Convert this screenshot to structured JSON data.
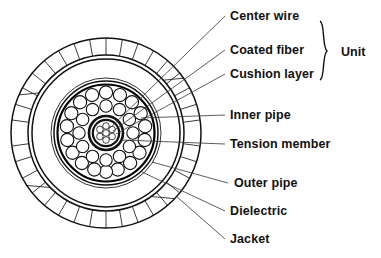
{
  "diagram": {
    "type": "cable-cross-section",
    "colors": {
      "line": "#111111",
      "background": "#ffffff",
      "leader": "#333333"
    },
    "geometry": {
      "center_x": 106,
      "center_y": 133,
      "jacket_outer_radius": 95,
      "jacket_inner_radius": 78,
      "outer_pipe_radius": 74,
      "dielectric_radius": 55,
      "inner_pipe_outer_radius": 52,
      "inner_pipe_inner_radius": 49,
      "unit_ring_radius": 38,
      "unit_count_outer": 18,
      "unit_count_inner": 12,
      "tension_member_radius": 17,
      "center_wire_radius": 3
    }
  },
  "labels": [
    {
      "id": "center-wire",
      "text": "Center wire",
      "x": 230,
      "y": 20,
      "leader_to_x": 118,
      "leader_to_y": 126
    },
    {
      "id": "coated-fiber",
      "text": "Coated fiber",
      "x": 230,
      "y": 54,
      "leader_to_x": 120,
      "leader_to_y": 131
    },
    {
      "id": "cushion-layer",
      "text": "Cushion layer",
      "x": 230,
      "y": 78,
      "leader_to_x": 123,
      "leader_to_y": 136
    },
    {
      "id": "inner-pipe",
      "text": "Inner pipe",
      "x": 230,
      "y": 119,
      "leader_to_x": 140,
      "leader_to_y": 120
    },
    {
      "id": "tension-member",
      "text": "Tension member",
      "x": 230,
      "y": 148,
      "leader_to_x": 124,
      "leader_to_y": 141
    },
    {
      "id": "outer-pipe",
      "text": "Outer pipe",
      "x": 234,
      "y": 187,
      "leader_to_x": 150,
      "leader_to_y": 163
    },
    {
      "id": "dielectric",
      "text": "Dielectric",
      "x": 230,
      "y": 215,
      "leader_to_x": 145,
      "leader_to_y": 176
    },
    {
      "id": "jacket",
      "text": "Jacket",
      "x": 230,
      "y": 243,
      "leader_to_x": 172,
      "leader_to_y": 194
    }
  ],
  "brace": {
    "label": "Unit",
    "label_x": 341,
    "label_y": 54,
    "top_y": 22,
    "bottom_y": 80,
    "x": 326,
    "groups": [
      "Center wire",
      "Coated fiber",
      "Cushion layer"
    ]
  }
}
